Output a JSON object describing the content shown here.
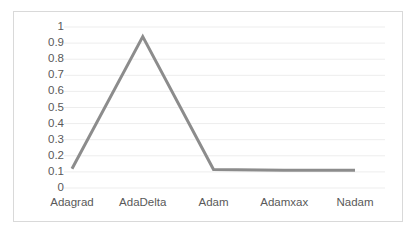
{
  "chart_data": {
    "type": "line",
    "title": "",
    "xlabel": "",
    "ylabel": "",
    "categories": [
      "Adagrad",
      "AdaDelta",
      "Adam",
      "Adamxax",
      "Nadam"
    ],
    "values": [
      0.12,
      0.94,
      0.115,
      0.11,
      0.11
    ],
    "series": [
      {
        "name": "",
        "values": [
          0.12,
          0.94,
          0.115,
          0.11,
          0.11
        ]
      }
    ],
    "ylim": [
      0,
      1
    ],
    "ytick_labels": [
      "1",
      "0.9",
      "0.8",
      "0.7",
      "0.6",
      "0.5",
      "0.4",
      "0.3",
      "0.2",
      "0.1",
      "0"
    ],
    "ytick_values": [
      1,
      0.9,
      0.8,
      0.7,
      0.6,
      0.5,
      0.4,
      0.3,
      0.2,
      0.1,
      0
    ],
    "grid": true,
    "grid_axis": "y",
    "legend": false,
    "legend_position": "none",
    "colors": {
      "line": "#8c8c8c",
      "gridline": "#ededed",
      "border": "#d9d9d9",
      "tick_text": "#595959",
      "background": "#ffffff"
    },
    "line_width": 3
  }
}
